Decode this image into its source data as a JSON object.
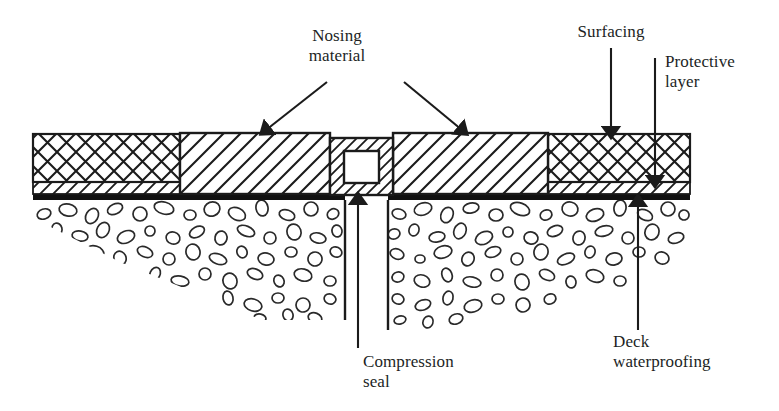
{
  "diagram": {
    "type": "engineering-cross-section",
    "colors": {
      "line": "#1b1b1b",
      "waterproofing": "#111111",
      "background": "#ffffff",
      "hatch": "#222222"
    },
    "labels": {
      "nosing_material": "Nosing\nmaterial",
      "surfacing": "Surfacing",
      "protective_layer": "Protective\nlayer",
      "compression_seal": "Compression\nseal",
      "deck_waterproofing": "Deck\nwaterproofing"
    },
    "layers": [
      {
        "name": "surfacing",
        "label": "Surfacing",
        "pattern": "cross-hatch",
        "position": "top wearing course, both outer ends"
      },
      {
        "name": "nosing-material",
        "label": "Nosing material",
        "pattern": "diagonal-hatch",
        "position": "either side of the joint gap"
      },
      {
        "name": "protective-layer",
        "label": "Protective layer",
        "pattern": "thin diagonal-hatch strip",
        "position": "below surfacing, above waterproofing"
      },
      {
        "name": "deck-waterproofing",
        "label": "Deck waterproofing",
        "pattern": "solid black membrane",
        "position": "directly on concrete deck"
      },
      {
        "name": "compression-seal",
        "label": "Compression seal",
        "pattern": "hollow hatched box",
        "position": "within the joint gap"
      },
      {
        "name": "concrete-deck",
        "label": "Concrete deck",
        "pattern": "aggregate stipple",
        "position": "structure below waterproofing"
      }
    ]
  }
}
